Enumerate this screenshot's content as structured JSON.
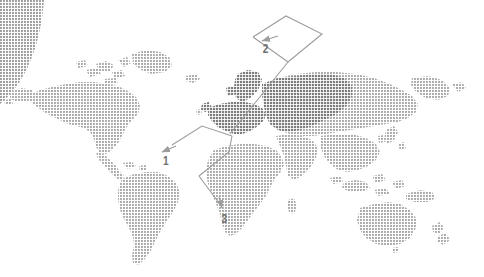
{
  "figure": {
    "type": "world-map-callout-diagram",
    "background_color": "#ffffff",
    "map_fill_color": "#a8a8a8",
    "map_highlight_color": "#8a8a8a",
    "corner_arc_color": "#9a9a9a",
    "leader_line_color": "#9d9d9d",
    "label_color": "#6e6e6e",
    "texture": "halftone-dot"
  },
  "corner_decoration": {
    "name": "quarter-circle-arc",
    "position": "top-left"
  },
  "map": {
    "name": "world-map",
    "projection": "equirectangular",
    "highlighted_region": "Europe",
    "regions": [
      "North America",
      "South America",
      "Greenland",
      "Europe",
      "Africa",
      "Asia",
      "Australia",
      "New Zealand"
    ]
  },
  "callouts": [
    {
      "id": "callout-1",
      "label": "1",
      "label_x": 163,
      "label_y": 160,
      "points_to": "Western Europe"
    },
    {
      "id": "callout-2",
      "label": "2",
      "label_x": 263,
      "label_y": 48,
      "points_to": "Northern Europe"
    },
    {
      "id": "callout-3",
      "label": "3",
      "label_x": 222,
      "label_y": 218,
      "points_to": "Southern Europe"
    }
  ]
}
